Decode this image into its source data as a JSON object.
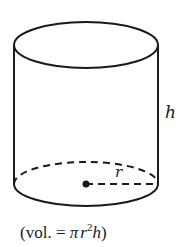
{
  "diagram": {
    "type": "cylinder",
    "stroke_color": "#1a1a1a",
    "background_color": "#ffffff",
    "top_ellipse": {
      "cx": 86,
      "cy": 45,
      "rx": 72,
      "ry": 23
    },
    "bottom_ellipse": {
      "cx": 86,
      "cy": 184,
      "rx": 72,
      "ry": 22,
      "back_half_dashed": true
    },
    "center_point": {
      "x": 86,
      "y": 184
    },
    "labels": {
      "height": "h",
      "radius": "r"
    },
    "caption": {
      "open": "(vol. = ",
      "pi": "π",
      "r": "r",
      "exp": "2",
      "h": "h",
      "close": ")"
    }
  }
}
